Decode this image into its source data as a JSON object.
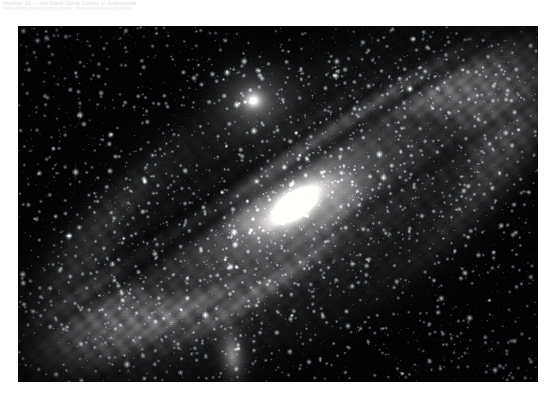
{
  "page": {
    "background_color": "#ffffff",
    "width": 557,
    "height": 406
  },
  "caption": {
    "line1": "Messier 31 — the Great Spiral Galaxy in Andromeda",
    "line2": "wide-field photographic plate, blue-sensitive emulsion",
    "color": "#d8dadd"
  },
  "photo": {
    "name": "andromeda-galaxy-photograph",
    "alt": "Black and white astronomical photograph of the Andromeda Galaxy (M31) with its two satellite galaxies",
    "frame": {
      "x": 18,
      "y": 26,
      "width": 520,
      "height": 356
    },
    "sky_color": "#040406",
    "core_color": "#ffffff",
    "disk_color": "#b9bdc2",
    "dust_lane_color": "#12131a",
    "objects": [
      {
        "label": "M31 nucleus",
        "type": "galaxy-core",
        "cx": 277,
        "cy": 179,
        "rx": 58,
        "ry": 30,
        "angle": -33
      },
      {
        "label": "M31 disk",
        "type": "spiral-disk",
        "cx": 277,
        "cy": 179,
        "rx": 268,
        "ry": 104,
        "angle": -33
      },
      {
        "label": "M32",
        "type": "satellite-galaxy",
        "cx": 235,
        "cy": 74,
        "rx": 13,
        "ry": 12,
        "angle": 0
      },
      {
        "label": "M110",
        "type": "satellite-galaxy",
        "cx": 214,
        "cy": 329,
        "rx": 15,
        "ry": 31,
        "angle": -8
      }
    ]
  }
}
